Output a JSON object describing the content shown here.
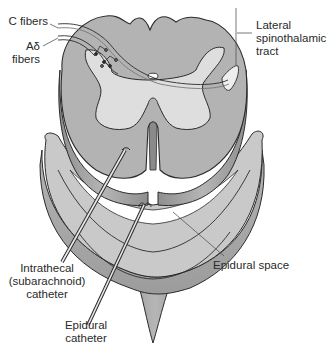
{
  "diagram": {
    "colors": {
      "background": "#ffffff",
      "outline": "#2b2b2b",
      "white_matter": "#b9b9b9",
      "white_matter_side": "#9a9a9a",
      "gray_matter": "#dcdcdc",
      "dura_top": "#c6c6c6",
      "dura_side": "#a6a6a6",
      "epidural_space": "#ffffff",
      "leader_line": "#555555"
    },
    "labels": {
      "c_fibers": "C fibers",
      "a_delta_line1": "Aδ",
      "a_delta_line2": "fibers",
      "lateral_tract_line1": "Lateral",
      "lateral_tract_line2": "spinothalamic",
      "lateral_tract_line3": "tract",
      "intrathecal_line1": "Intrathecal",
      "intrathecal_line2": "(subarachnoid)",
      "intrathecal_line3": "catheter",
      "epidural_space": "Epidural space",
      "epidural_cath_line1": "Epidural",
      "epidural_cath_line2": "catheter"
    }
  }
}
